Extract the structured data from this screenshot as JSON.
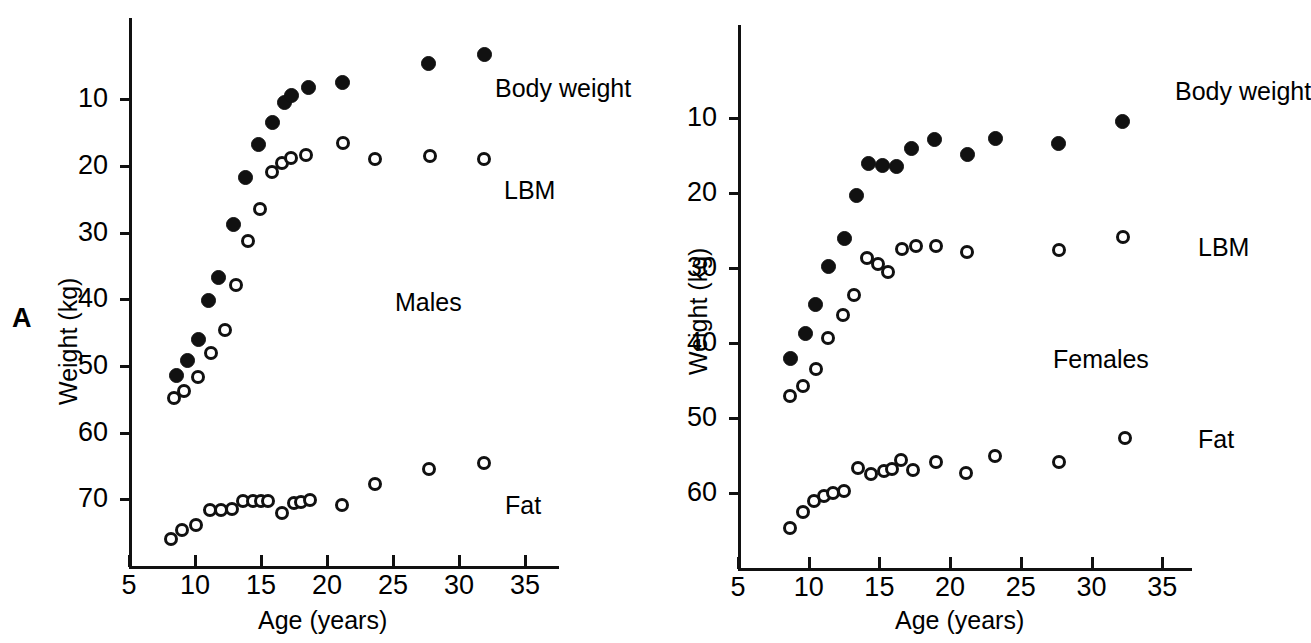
{
  "figure": {
    "panel_letter": "A",
    "background_color": "#ffffff",
    "ink_color": "#111111"
  },
  "chart_data": [
    {
      "type": "scatter",
      "panel": "A-left",
      "title": "",
      "group_label": "Males",
      "xlabel": "Age (years)",
      "ylabel": "Weight (kg)",
      "xlim": [
        5,
        35
      ],
      "ylim": [
        0,
        78
      ],
      "xticks": [
        5,
        10,
        15,
        20,
        25,
        30,
        35
      ],
      "yticks": [
        10,
        20,
        30,
        40,
        50,
        60,
        70
      ],
      "grid": false,
      "legend_position": "inline-right",
      "series": [
        {
          "name": "Body weight",
          "marker": "filled-circle",
          "points": [
            [
              8.6,
              28.6
            ],
            [
              9.4,
              30.9
            ],
            [
              10.3,
              34.0
            ],
            [
              11.0,
              39.8
            ],
            [
              11.8,
              43.3
            ],
            [
              12.9,
              51.2
            ],
            [
              13.8,
              58.3
            ],
            [
              14.8,
              63.3
            ],
            [
              15.9,
              66.6
            ],
            [
              16.8,
              69.5
            ],
            [
              17.3,
              70.6
            ],
            [
              18.6,
              71.8
            ],
            [
              21.2,
              72.6
            ],
            [
              27.7,
              75.4
            ],
            [
              31.9,
              76.7
            ]
          ]
        },
        {
          "name": "LBM",
          "marker": "open-circle",
          "points": [
            [
              8.4,
              25.2
            ],
            [
              9.2,
              26.2
            ],
            [
              10.2,
              28.3
            ],
            [
              11.2,
              32.0
            ],
            [
              12.3,
              35.4
            ],
            [
              13.1,
              42.1
            ],
            [
              14.0,
              48.8
            ],
            [
              14.9,
              53.5
            ],
            [
              15.8,
              59.1
            ],
            [
              16.6,
              60.5
            ],
            [
              17.3,
              61.2
            ],
            [
              18.4,
              61.7
            ],
            [
              21.2,
              63.4
            ],
            [
              23.6,
              61.0
            ],
            [
              27.8,
              61.5
            ],
            [
              31.9,
              61.0
            ]
          ]
        },
        {
          "name": "Fat",
          "marker": "open-circle",
          "points": [
            [
              8.2,
              4.0
            ],
            [
              9.0,
              5.4
            ],
            [
              10.1,
              6.2
            ],
            [
              11.1,
              8.4
            ],
            [
              12.0,
              8.4
            ],
            [
              12.8,
              8.5
            ],
            [
              13.6,
              9.8
            ],
            [
              14.4,
              9.7
            ],
            [
              15.0,
              9.7
            ],
            [
              15.5,
              9.7
            ],
            [
              16.6,
              8.0
            ],
            [
              17.5,
              9.4
            ],
            [
              18.0,
              9.6
            ],
            [
              18.7,
              9.9
            ],
            [
              21.1,
              9.2
            ],
            [
              23.6,
              12.3
            ],
            [
              27.7,
              14.6
            ],
            [
              31.9,
              15.5
            ]
          ]
        }
      ]
    },
    {
      "type": "scatter",
      "panel": "A-right",
      "title": "",
      "group_label": "Females",
      "xlabel": "Age (years)",
      "ylabel": "Weight (kg)",
      "xlim": [
        5,
        35
      ],
      "ylim": [
        0,
        65
      ],
      "xticks": [
        5,
        10,
        15,
        20,
        25,
        30,
        35
      ],
      "yticks": [
        10,
        20,
        30,
        40,
        50,
        60
      ],
      "grid": false,
      "legend_position": "inline-right",
      "series": [
        {
          "name": "Body weight",
          "marker": "filled-circle",
          "points": [
            [
              8.7,
              28.0
            ],
            [
              9.8,
              31.3
            ],
            [
              10.5,
              35.1
            ],
            [
              11.4,
              40.2
            ],
            [
              12.5,
              44.0
            ],
            [
              13.4,
              49.7
            ],
            [
              14.2,
              53.9
            ],
            [
              15.2,
              53.7
            ],
            [
              16.2,
              53.6
            ],
            [
              17.3,
              55.9
            ],
            [
              18.9,
              57.2
            ],
            [
              21.2,
              55.1
            ],
            [
              23.2,
              57.3
            ],
            [
              27.7,
              56.6
            ],
            [
              32.2,
              59.6
            ]
          ]
        },
        {
          "name": "LBM",
          "marker": "open-circle",
          "points": [
            [
              8.7,
              22.9
            ],
            [
              9.6,
              24.3
            ],
            [
              10.5,
              26.6
            ],
            [
              11.4,
              30.7
            ],
            [
              12.4,
              33.7
            ],
            [
              13.2,
              36.4
            ],
            [
              14.1,
              41.3
            ],
            [
              14.9,
              40.5
            ],
            [
              15.6,
              39.5
            ],
            [
              16.6,
              42.6
            ],
            [
              17.6,
              43.0
            ],
            [
              19.0,
              42.9
            ],
            [
              21.2,
              42.1
            ],
            [
              27.7,
              42.4
            ],
            [
              32.2,
              44.2
            ]
          ]
        },
        {
          "name": "Fat",
          "marker": "open-circle",
          "points": [
            [
              8.7,
              5.4
            ],
            [
              9.6,
              7.5
            ],
            [
              10.4,
              9.0
            ],
            [
              11.1,
              9.6
            ],
            [
              11.7,
              10.0
            ],
            [
              12.5,
              10.3
            ],
            [
              13.5,
              13.4
            ],
            [
              14.4,
              12.6
            ],
            [
              15.3,
              13.0
            ],
            [
              15.9,
              13.2
            ],
            [
              16.5,
              14.4
            ],
            [
              17.4,
              13.1
            ],
            [
              19.0,
              14.1
            ],
            [
              21.1,
              12.7
            ],
            [
              23.2,
              15.0
            ],
            [
              27.7,
              14.2
            ],
            [
              32.4,
              17.3
            ]
          ]
        }
      ]
    }
  ],
  "panels": {
    "males": {
      "group_label": "Males",
      "xlabel": "Age (years)",
      "ylabel": "Weight (kg)",
      "xticks": [
        "5",
        "10",
        "15",
        "20",
        "25",
        "30",
        "35"
      ],
      "yticks": [
        "70",
        "60",
        "50",
        "40",
        "30",
        "20",
        "10"
      ],
      "series_labels": {
        "body_weight": "Body weight",
        "lbm": "LBM",
        "fat": "Fat"
      }
    },
    "females": {
      "group_label": "Females",
      "xlabel": "Age (years)",
      "ylabel": "Weight (kg)",
      "xticks": [
        "5",
        "10",
        "15",
        "20",
        "25",
        "30",
        "35"
      ],
      "yticks": [
        "60",
        "50",
        "40",
        "30",
        "20",
        "10"
      ],
      "series_labels": {
        "body_weight": "Body weight",
        "lbm": "LBM",
        "fat": "Fat"
      }
    }
  }
}
